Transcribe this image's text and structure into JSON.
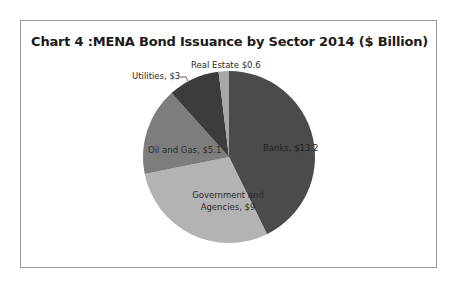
{
  "chart_data": {
    "type": "pie",
    "title": "Chart 4 :MENA Bond Issuance by Sector 2014 ($ Billion)",
    "unit": "$ Billion",
    "categories": [
      "Banks",
      "Government and Agencies",
      "Oil and Gas",
      "Utilities",
      "Real Estate"
    ],
    "values": [
      13.2,
      9,
      5.1,
      3,
      0.6
    ],
    "colors": [
      "#4b4b4b",
      "#b3b3b3",
      "#7d7d7d",
      "#3c3c3c",
      "#a8a8a8"
    ],
    "data_labels": [
      "Banks, $13.2",
      "Government and Agencies, $9",
      "Oil and Gas, $5.1",
      "Utilities, $3",
      "Real Estate $0.6"
    ],
    "start_angle": "12 o'clock, clockwise",
    "legend": "none (data labels on slices)"
  },
  "labels": {
    "banks": "Banks, $13.2",
    "gov_line1": "Government and",
    "gov_line2": "Agencies, $9",
    "oil": "Oil and Gas, $5.1",
    "utilities": "Utilities, $3",
    "real_estate": "Real Estate $0.6"
  }
}
